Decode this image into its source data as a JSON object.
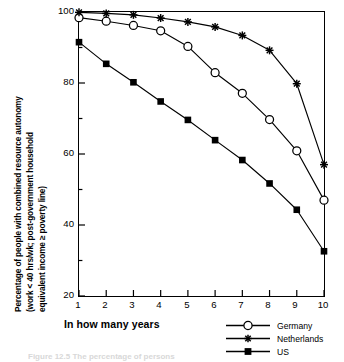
{
  "chart_data": {
    "type": "line",
    "title": "",
    "xlabel": "In how many years",
    "ylabel": "Percentage of people with combined resource autonomy (work < 40 hrs/wk; post-government household equivalent income ≥ poverty line)",
    "ylabel_lines": [
      "Percentage of people with combined resource autonomy",
      "(work < 40 hrs/wk; post-government household",
      "equivalent income ≥ poverty line)"
    ],
    "x": [
      1,
      2,
      3,
      4,
      5,
      6,
      7,
      8,
      9,
      10
    ],
    "xlim": [
      1,
      10
    ],
    "ylim": [
      20,
      100
    ],
    "xticks": [
      "1",
      "2",
      "3",
      "4",
      "5",
      "6",
      "7",
      "8",
      "9",
      "10"
    ],
    "yticks": [
      "20",
      "40",
      "60",
      "80",
      "100"
    ],
    "yticks_minor": [
      30,
      50,
      70,
      90
    ],
    "grid": false,
    "legend_position": "bottom-right",
    "series": [
      {
        "name": "Germany",
        "marker": "open-circle",
        "values": [
          98.4,
          97.4,
          96.2,
          94.7,
          90.3,
          82.9,
          77.1,
          69.7,
          60.9,
          47.0
        ]
      },
      {
        "name": "Netherlands",
        "marker": "star",
        "values": [
          99.9,
          99.6,
          99.2,
          98.3,
          97.2,
          95.8,
          93.4,
          89.2,
          79.8,
          57.0
        ]
      },
      {
        "name": "US",
        "marker": "filled-square",
        "values": [
          91.5,
          85.4,
          80.2,
          74.8,
          69.6,
          63.9,
          58.3,
          51.7,
          44.3,
          32.6
        ]
      }
    ]
  },
  "axes": {
    "x_title": "In how many years"
  },
  "legend": {
    "entries": [
      {
        "label": "Germany",
        "marker": "open-circle"
      },
      {
        "label": "Netherlands",
        "marker": "star"
      },
      {
        "label": "US",
        "marker": "filled-square"
      }
    ]
  },
  "caption": {
    "text": "Figure 12.5  The percentage of persons"
  }
}
